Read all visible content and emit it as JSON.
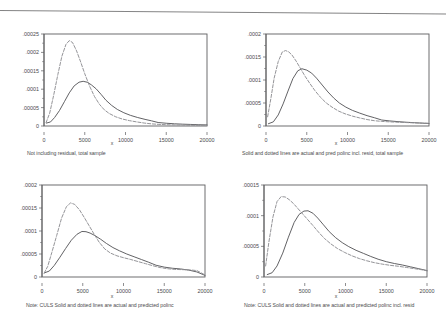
{
  "figure": {
    "title": "",
    "panel_count": 4
  },
  "chart_data": [
    {
      "type": "line",
      "panel": "top-left",
      "title": "",
      "caption": "Not including residual, total sample",
      "xlabel": "x",
      "ylabel": "",
      "xlim": [
        0,
        20000
      ],
      "ylim": [
        0,
        0.00025
      ],
      "xticks": [
        0,
        5000,
        10000,
        15000,
        20000
      ],
      "xticklabels": [
        "0",
        "5000",
        "10000",
        "15000",
        "20000"
      ],
      "yticks": [
        0,
        5e-05,
        0.0001,
        0.00015,
        0.0002,
        0.00025
      ],
      "yticklabels": [
        "0",
        ".00005",
        ".0001",
        ".00015",
        ".0002",
        ".00025"
      ],
      "grid": false,
      "legend": null,
      "series": [
        {
          "name": "actual",
          "style": "solid",
          "color": "#5a5a5d",
          "x": [
            300,
            800,
            1300,
            1900,
            2500,
            3100,
            3700,
            4300,
            4800,
            5300,
            5800,
            6400,
            7000,
            7600,
            8300,
            9000,
            9800,
            10600,
            11500,
            12400,
            13200,
            14000,
            15000,
            16000,
            17000,
            18000,
            19000,
            20000
          ],
          "values": [
            8e-06,
            1.1e-05,
            2.3e-05,
            4.2e-05,
            6.6e-05,
            9e-05,
            0.000109,
            0.000119,
            0.0001215,
            0.000119,
            0.000112,
            0.000101,
            8.6e-05,
            7e-05,
            5.6e-05,
            4.5e-05,
            3.6e-05,
            2.9e-05,
            2.3e-05,
            1.8e-05,
            1.4e-05,
            9.5e-06,
            7.5e-06,
            6e-06,
            5e-06,
            4.2e-06,
            3.5e-06,
            3e-06
          ]
        },
        {
          "name": "predicted polinc",
          "style": "dashed",
          "color": "#8e8e92",
          "x": [
            250,
            700,
            1200,
            1700,
            2200,
            2700,
            3100,
            3500,
            4000,
            4500,
            5000,
            5600,
            6200,
            6800,
            7400,
            8000,
            8800,
            9600,
            10500,
            11400,
            12300,
            13200,
            14000,
            15000,
            16000,
            17000,
            18000,
            19000,
            20000
          ],
          "values": [
            9e-06,
            3.5e-05,
            8.5e-05,
            0.00014,
            0.00019,
            0.000222,
            0.000232,
            0.000227,
            0.000204,
            0.000174,
            0.000142,
            0.000108,
            8e-05,
            5.9e-05,
            4.4e-05,
            3.4e-05,
            2.5e-05,
            1.9e-05,
            1.45e-05,
            1.1e-05,
            8e-06,
            5.8e-06,
            4.5e-06,
            3.5e-06,
            3e-06,
            2.6e-06,
            2.2e-06,
            2e-06,
            1.8e-06
          ]
        }
      ]
    },
    {
      "type": "line",
      "panel": "top-right",
      "title": "",
      "caption": "Solid and dotted lines are actual and pred polinc incl. resid, total sample",
      "xlabel": "x",
      "ylabel": "",
      "xlim": [
        0,
        20000
      ],
      "ylim": [
        0,
        0.0002
      ],
      "xticks": [
        0,
        5000,
        10000,
        15000,
        20000
      ],
      "xticklabels": [
        "0",
        "5000",
        "10000",
        "15000",
        "20000"
      ],
      "yticks": [
        0,
        5e-05,
        0.0001,
        0.00015,
        0.0002
      ],
      "yticklabels": [
        "0",
        ".00005",
        ".0001",
        ".00015",
        ".0002"
      ],
      "grid": false,
      "legend": null,
      "series": [
        {
          "name": "actual",
          "style": "solid",
          "color": "#5a5a5d",
          "x": [
            300,
            900,
            1500,
            2100,
            2700,
            3300,
            3900,
            4400,
            5000,
            5600,
            6200,
            6900,
            7600,
            8300,
            9000,
            9800,
            10600,
            11500,
            12400,
            13300,
            14200,
            15200,
            16200,
            17200,
            18200,
            19200,
            20000
          ],
          "values": [
            5e-06,
            9e-06,
            2.4e-05,
            4.8e-05,
            7.6e-05,
            0.000103,
            0.00012,
            0.0001245,
            0.0001215,
            0.000115,
            0.000104,
            8.9e-05,
            7.4e-05,
            6.1e-05,
            5e-05,
            4.1e-05,
            3.4e-05,
            2.8e-05,
            2.25e-05,
            1.8e-05,
            1.3e-05,
            1.1e-05,
            9.5e-06,
            8.2e-06,
            7.2e-06,
            6.2e-06,
            5.5e-06
          ]
        },
        {
          "name": "pred polinc incl. resid",
          "style": "dashed",
          "color": "#8e8e92",
          "x": [
            200,
            600,
            1000,
            1500,
            2000,
            2400,
            2800,
            3200,
            3700,
            4200,
            4800,
            5400,
            6000,
            6700,
            7400,
            8100,
            8900,
            9700,
            10600,
            11500,
            12400,
            13300,
            14200,
            15200,
            16200,
            17200,
            18200,
            19200,
            20000
          ],
          "values": [
            2e-05,
            6e-05,
            0.000104,
            0.00014,
            0.000161,
            0.000164,
            0.000161,
            0.000154,
            0.000141,
            0.000126,
            0.000108,
            9.2e-05,
            7.7e-05,
            6.2e-05,
            5e-05,
            4.1e-05,
            3.25e-05,
            2.65e-05,
            2.15e-05,
            1.75e-05,
            1.4e-05,
            1.15e-05,
            1e-05,
            9e-06,
            8.2e-06,
            7.5e-06,
            6.8e-06,
            6.2e-06,
            5.8e-06
          ]
        }
      ]
    },
    {
      "type": "line",
      "panel": "bottom-left",
      "title": "",
      "caption": "Note: CULS Solid and dotted lines are actual and predicted polinc",
      "xlabel": "x",
      "ylabel": "",
      "xlim": [
        0,
        20000
      ],
      "ylim": [
        0,
        0.0002
      ],
      "xticks": [
        0,
        5000,
        10000,
        15000,
        20000
      ],
      "xticklabels": [
        "0",
        "5000",
        "10000",
        "15000",
        "20000"
      ],
      "yticks": [
        0,
        5e-05,
        0.0001,
        0.00015,
        0.0002
      ],
      "yticklabels": [
        "0",
        ".00005",
        ".0001",
        ".00015",
        ".0002"
      ],
      "grid": false,
      "legend": null,
      "series": [
        {
          "name": "actual",
          "style": "solid",
          "color": "#5a5a5d",
          "x": [
            300,
            900,
            1500,
            2200,
            2900,
            3600,
            4300,
            4900,
            5400,
            5900,
            6500,
            7200,
            7900,
            8700,
            9500,
            10400,
            11300,
            12200,
            13100,
            14000,
            15000,
            16000,
            17000,
            18000,
            19000,
            20000
          ],
          "values": [
            9e-06,
            1.3e-05,
            2.5e-05,
            4.3e-05,
            6.2e-05,
            8e-05,
            9.3e-05,
            9.9e-05,
            9.85e-05,
            9.55e-05,
            9e-05,
            8.2e-05,
            7.3e-05,
            6.4e-05,
            5.7e-05,
            5e-05,
            4.4e-05,
            3.8e-05,
            3.2e-05,
            2.55e-05,
            2.15e-05,
            1.9e-05,
            1.75e-05,
            1.5e-05,
            1.1e-05,
            3.5e-06
          ]
        },
        {
          "name": "predicted polinc",
          "style": "dashed",
          "color": "#8e8e92",
          "x": [
            250,
            700,
            1200,
            1800,
            2400,
            3000,
            3500,
            4000,
            4600,
            5200,
            5800,
            6400,
            7000,
            7700,
            8400,
            9200,
            10000,
            10900,
            11800,
            12700,
            13600,
            14500,
            15400,
            16300,
            17200,
            18100,
            19000,
            20000
          ],
          "values": [
            8e-06,
            2.3e-05,
            5.3e-05,
            9e-05,
            0.000128,
            0.000153,
            0.000161,
            0.000158,
            0.000146,
            0.000129,
            0.000111,
            9.3e-05,
            7.6e-05,
            6.1e-05,
            5.2e-05,
            4.6e-05,
            4.2e-05,
            3.8e-05,
            3.35e-05,
            2.9e-05,
            2.45e-05,
            2.05e-05,
            1.8e-05,
            1.65e-05,
            1.6e-05,
            1.55e-05,
            1.4e-05,
            4.5e-06
          ]
        }
      ]
    },
    {
      "type": "line",
      "panel": "bottom-right",
      "title": "",
      "caption": "Note: CULS Solid and dotted lines are actual and predicted polinc incl. resid",
      "xlabel": "x",
      "ylabel": "",
      "xlim": [
        0,
        20000
      ],
      "ylim": [
        0,
        0.00015
      ],
      "xticks": [
        0,
        5000,
        10000,
        15000,
        20000
      ],
      "xticklabels": [
        "0",
        "5000",
        "10000",
        "15000",
        "20000"
      ],
      "yticks": [
        0,
        5e-05,
        0.0001,
        0.00015
      ],
      "yticklabels": [
        "0",
        ".00005",
        ".0001",
        ".00015"
      ],
      "grid": false,
      "legend": null,
      "series": [
        {
          "name": "actual",
          "style": "solid",
          "color": "#5a5a5d",
          "x": [
            400,
            1000,
            1600,
            2300,
            3000,
            3700,
            4300,
            4900,
            5400,
            6000,
            6600,
            7300,
            8000,
            8800,
            9600,
            10400,
            11300,
            12200,
            13100,
            14000,
            15000,
            16000,
            17000,
            18000,
            19000,
            20000
          ],
          "values": [
            4e-06,
            7e-06,
            1.8e-05,
            3.9e-05,
            6.5e-05,
            8.9e-05,
            0.000102,
            0.0001075,
            0.000108,
            0.000104,
            9.6e-05,
            8.5e-05,
            7.4e-05,
            6.4e-05,
            5.6e-05,
            4.95e-05,
            4.35e-05,
            3.85e-05,
            3.35e-05,
            2.9e-05,
            2.5e-05,
            2.2e-05,
            1.95e-05,
            1.65e-05,
            1.35e-05,
            1.05e-05
          ]
        },
        {
          "name": "predicted polinc incl. resid",
          "style": "dashed",
          "color": "#8e8e92",
          "x": [
            200,
            600,
            1100,
            1600,
            2100,
            2600,
            3100,
            3600,
            4200,
            4800,
            5400,
            6000,
            6700,
            7400,
            8200,
            9000,
            9900,
            10800,
            11700,
            12600,
            13500,
            14500,
            15500,
            16500,
            17500,
            18500,
            19500,
            20000
          ],
          "values": [
            1.8e-05,
            5.7e-05,
            9.8e-05,
            0.000123,
            0.000131,
            0.0001305,
            0.000126,
            0.00012,
            0.000111,
            0.000102,
            9.3e-05,
            8.4e-05,
            7.3e-05,
            6.3e-05,
            5.4e-05,
            4.65e-05,
            4e-05,
            3.45e-05,
            3e-05,
            2.65e-05,
            2.35e-05,
            2.1e-05,
            1.9e-05,
            1.75e-05,
            1.55e-05,
            1.35e-05,
            1.15e-05,
            1e-05
          ]
        }
      ]
    }
  ]
}
